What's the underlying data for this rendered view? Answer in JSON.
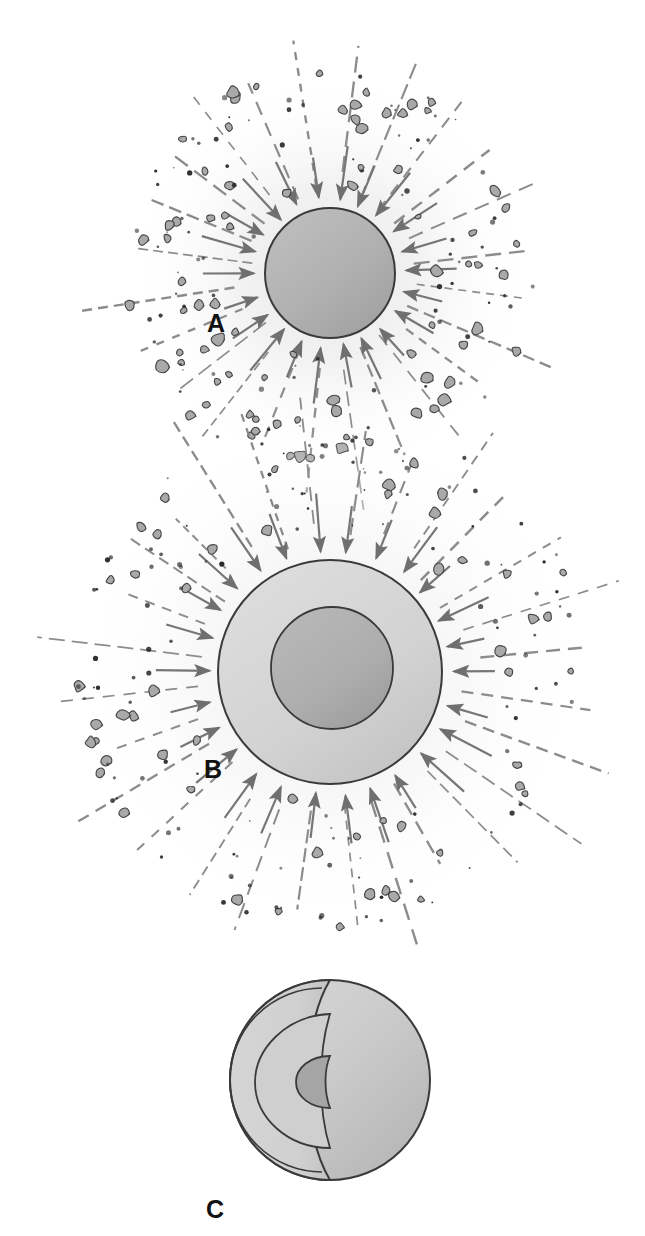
{
  "figure": {
    "background_color": "#ffffff",
    "width": 645,
    "height": 1236
  },
  "palette": {
    "body_gray": "#b0b0b0",
    "mantle_light": "#d2d2d2",
    "core_dark": "#a8a8a8",
    "crust_shell": "#c4c4c4",
    "outline": "#3a3a3a",
    "ray_gray": "#8c8c8c",
    "arrow_gray": "#767676",
    "particle_fill": "#a9a9a9",
    "particle_outline": "#444444",
    "dust_dot": "#2b2b2b",
    "halo_tint": "#f0f0f0",
    "label_color": "#111111"
  },
  "panels": [
    {
      "id": "A",
      "label": "A",
      "label_x": 207,
      "label_y": 332,
      "description": "Small accreting body bombarded by infalling planetesimals",
      "center_x": 330,
      "center_y": 273,
      "layers": [
        {
          "name": "body",
          "radius": 65,
          "fill": "#b0b0b0"
        }
      ],
      "halo_radius": 200,
      "ray_count": 24,
      "ray_inner": 78,
      "ray_outer": 250,
      "arrow_inner": 72,
      "arrow_length": 34,
      "particle_ring_min": 74,
      "particle_ring_max": 205
    },
    {
      "id": "B",
      "label": "B",
      "label_x": 204,
      "label_y": 778,
      "description": "Larger differentiated body with dense core forming inside lighter mantle",
      "center_x": 330,
      "center_y": 672,
      "layers": [
        {
          "name": "mantle",
          "radius": 112,
          "fill": "#d2d2d2"
        },
        {
          "name": "core",
          "radius": 61,
          "fill": "#adadad",
          "offset_x": 2,
          "offset_y": -4
        }
      ],
      "halo_radius": 250,
      "ray_count": 28,
      "ray_inner": 126,
      "ray_outer": 300,
      "arrow_inner": 120,
      "arrow_length": 36,
      "particle_ring_min": 120,
      "particle_ring_max": 255
    },
    {
      "id": "C",
      "label": "C",
      "label_x": 206,
      "label_y": 1218,
      "description": "Cutaway of fully differentiated planet showing crust, mantle and core",
      "center_x": 330,
      "center_y": 1080,
      "layers": [
        {
          "name": "outer-sphere",
          "radius": 100,
          "fill": "#c9c9c9"
        },
        {
          "name": "crust-shell",
          "radius": 94,
          "fill": "#cfcfcf"
        },
        {
          "name": "mantle-cut",
          "radius": 62,
          "fill": "#cdcdcd"
        },
        {
          "name": "core-cut",
          "radius": 25,
          "fill": "#a5a5a5"
        }
      ]
    }
  ]
}
